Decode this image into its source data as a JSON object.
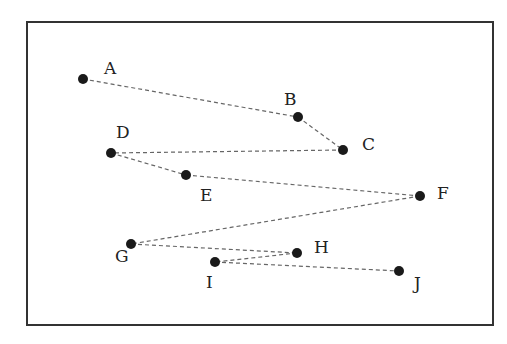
{
  "diagram": {
    "type": "point-path",
    "frame": {
      "x": 27,
      "y": 22,
      "width": 466,
      "height": 303
    },
    "colors": {
      "frame": "#333333",
      "line": "#666666",
      "point": "#1a1a1a",
      "label": "#222222"
    },
    "points": [
      {
        "id": "A",
        "label": "A",
        "x": 83,
        "y": 79,
        "lx": 104,
        "ly": 74
      },
      {
        "id": "B",
        "label": "B",
        "x": 298,
        "y": 117,
        "lx": 284,
        "ly": 105
      },
      {
        "id": "C",
        "label": "C",
        "x": 343,
        "y": 150,
        "lx": 362,
        "ly": 150
      },
      {
        "id": "D",
        "label": "D",
        "x": 111,
        "y": 153,
        "lx": 116,
        "ly": 138
      },
      {
        "id": "E",
        "label": "E",
        "x": 186,
        "y": 175,
        "lx": 200,
        "ly": 201
      },
      {
        "id": "F",
        "label": "F",
        "x": 420,
        "y": 196,
        "lx": 437,
        "ly": 199
      },
      {
        "id": "G",
        "label": "G",
        "x": 131,
        "y": 244,
        "lx": 115,
        "ly": 262
      },
      {
        "id": "H",
        "label": "H",
        "x": 297,
        "y": 253,
        "lx": 314,
        "ly": 253
      },
      {
        "id": "I",
        "label": "I",
        "x": 215,
        "y": 262,
        "lx": 206,
        "ly": 288
      },
      {
        "id": "J",
        "label": "J",
        "x": 399,
        "y": 271,
        "lx": 414,
        "ly": 289
      }
    ],
    "path_order": [
      "A",
      "B",
      "C",
      "D",
      "E",
      "F",
      "G",
      "H",
      "I",
      "J"
    ],
    "line_style": "dashed"
  }
}
